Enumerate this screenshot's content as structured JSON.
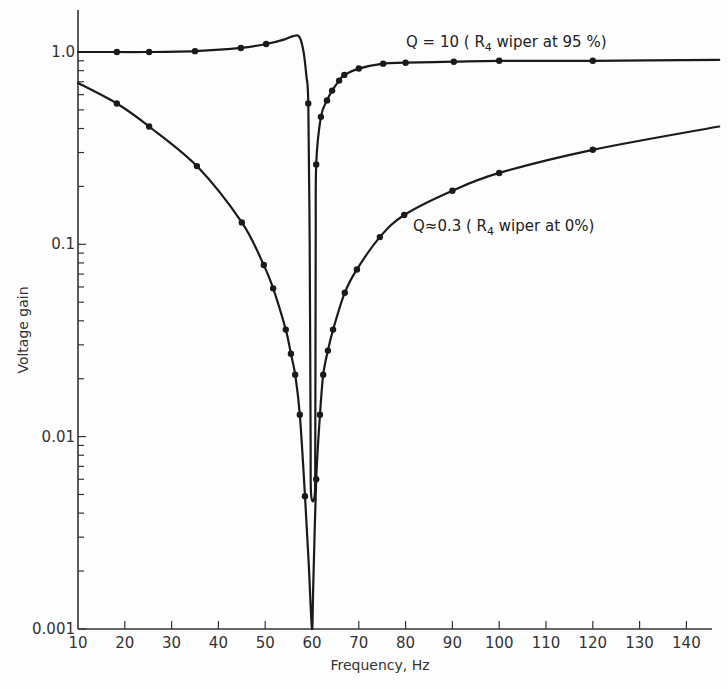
{
  "chart_data": {
    "type": "line",
    "title": "",
    "xlabel": "Frequency, Hz",
    "ylabel": "Voltage gain",
    "xscale": "linear",
    "yscale": "log",
    "xlim": [
      10,
      147
    ],
    "ylim": [
      0.001,
      1.6
    ],
    "x_ticks": [
      10,
      20,
      30,
      40,
      50,
      60,
      70,
      80,
      90,
      100,
      110,
      120,
      130,
      140
    ],
    "y_ticks": [
      0.001,
      0.01,
      0.1,
      1.0
    ],
    "y_tick_labels": [
      "0.001",
      "0.01",
      "0.1",
      "1.0"
    ],
    "grid": false,
    "legend": "none (inline annotations)",
    "series": [
      {
        "name": "Q=10 (R4 wiper at 95%)",
        "annotation": {
          "prefix": "Q = 10 ( R",
          "sub": "4",
          "suffix": " wiper at 95 %)"
        },
        "curve": [
          [
            10,
            1.0
          ],
          [
            18.3,
            1.0
          ],
          [
            25.2,
            1.0
          ],
          [
            35,
            1.01
          ],
          [
            44.8,
            1.05
          ],
          [
            50.2,
            1.1
          ],
          [
            54,
            1.16
          ],
          [
            56,
            1.21
          ],
          [
            57.3,
            1.2
          ],
          [
            58.2,
            1.0
          ],
          [
            58.8,
            0.75
          ],
          [
            59.2,
            0.54
          ],
          [
            59.5,
            0.1
          ],
          [
            59.7,
            0.01
          ],
          [
            59.8,
            0.005
          ],
          [
            60.6,
            0.005
          ],
          [
            60.7,
            0.01
          ],
          [
            60.8,
            0.1
          ],
          [
            60.9,
            0.26
          ],
          [
            61.9,
            0.46
          ],
          [
            63.2,
            0.56
          ],
          [
            64.3,
            0.63
          ],
          [
            65.8,
            0.71
          ],
          [
            66.9,
            0.76
          ],
          [
            70,
            0.82
          ],
          [
            75.2,
            0.87
          ],
          [
            80,
            0.88
          ],
          [
            90.3,
            0.89
          ],
          [
            100,
            0.9
          ],
          [
            120,
            0.9
          ],
          [
            147,
            0.91
          ]
        ],
        "markers": [
          [
            18.3,
            1.0
          ],
          [
            25.2,
            1.0
          ],
          [
            35,
            1.01
          ],
          [
            44.8,
            1.05
          ],
          [
            50.2,
            1.1
          ],
          [
            59.2,
            0.54
          ],
          [
            60.9,
            0.26
          ],
          [
            61.9,
            0.46
          ],
          [
            63.2,
            0.56
          ],
          [
            64.3,
            0.63
          ],
          [
            65.8,
            0.71
          ],
          [
            66.9,
            0.76
          ],
          [
            70,
            0.82
          ],
          [
            75.2,
            0.87
          ],
          [
            80,
            0.88
          ],
          [
            90.3,
            0.89
          ],
          [
            100,
            0.9
          ],
          [
            120,
            0.9
          ]
        ]
      },
      {
        "name": "Q≈0.3 (R4 wiper at 0%)",
        "annotation": {
          "prefix": "Q≈0.3 ( R",
          "sub": "4",
          "suffix": " wiper at 0%)"
        },
        "curve": [
          [
            10,
            0.69
          ],
          [
            18.3,
            0.54
          ],
          [
            25.2,
            0.41
          ],
          [
            35.4,
            0.255
          ],
          [
            45,
            0.13
          ],
          [
            49.7,
            0.078
          ],
          [
            51.7,
            0.059
          ],
          [
            54.4,
            0.036
          ],
          [
            55.5,
            0.027
          ],
          [
            56.4,
            0.021
          ],
          [
            57.4,
            0.013
          ],
          [
            58.5,
            0.0049
          ],
          [
            59.3,
            0.0022
          ],
          [
            60,
            0.001
          ],
          [
            60.3,
            0.0018
          ],
          [
            60.9,
            0.006
          ],
          [
            61.7,
            0.013
          ],
          [
            62.4,
            0.021
          ],
          [
            63.4,
            0.028
          ],
          [
            64.5,
            0.036
          ],
          [
            67,
            0.056
          ],
          [
            69.6,
            0.074
          ],
          [
            74.5,
            0.109
          ],
          [
            79.7,
            0.142
          ],
          [
            90,
            0.19
          ],
          [
            100,
            0.235
          ],
          [
            120,
            0.31
          ],
          [
            147,
            0.41
          ]
        ],
        "markers": [
          [
            18.3,
            0.54
          ],
          [
            25.2,
            0.41
          ],
          [
            35.4,
            0.255
          ],
          [
            45,
            0.13
          ],
          [
            49.7,
            0.078
          ],
          [
            51.7,
            0.059
          ],
          [
            54.4,
            0.036
          ],
          [
            55.5,
            0.027
          ],
          [
            56.4,
            0.021
          ],
          [
            57.4,
            0.013
          ],
          [
            58.5,
            0.0049
          ],
          [
            60.9,
            0.006
          ],
          [
            61.7,
            0.013
          ],
          [
            62.4,
            0.021
          ],
          [
            63.4,
            0.028
          ],
          [
            64.5,
            0.036
          ],
          [
            67,
            0.056
          ],
          [
            69.6,
            0.074
          ],
          [
            74.5,
            0.109
          ],
          [
            79.7,
            0.142
          ],
          [
            90,
            0.19
          ],
          [
            100,
            0.235
          ],
          [
            120,
            0.31
          ]
        ]
      }
    ]
  },
  "layout": {
    "plot_left": 78,
    "plot_right": 712,
    "plot_top": 10,
    "plot_bottom": 629,
    "x0_px": 78,
    "px_per_hz": 4.68,
    "y_at_1": 52,
    "px_per_decade": 192.3,
    "annotations": [
      {
        "series": 0,
        "x": 406,
        "y": 47
      },
      {
        "series": 1,
        "x": 413,
        "y": 231
      }
    ]
  }
}
